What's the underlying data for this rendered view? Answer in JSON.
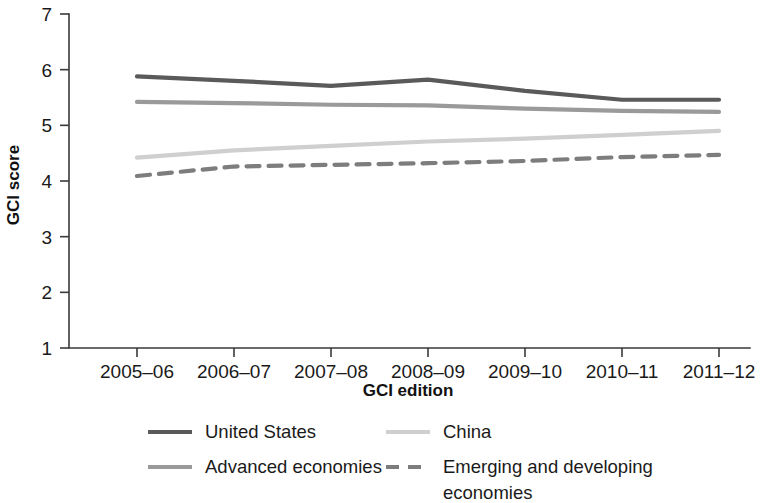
{
  "chart_data": {
    "type": "line",
    "title": "",
    "xlabel": "GCI edition",
    "ylabel": "GCI score",
    "categories": [
      "2005–06",
      "2006–07",
      "2007–08",
      "2008–09",
      "2009–10",
      "2010–11",
      "2011–12"
    ],
    "ylim": [
      1,
      7
    ],
    "yticks": [
      1,
      2,
      3,
      4,
      5,
      6,
      7
    ],
    "ytick_labels": [
      "1",
      "2",
      "3",
      "4",
      "5",
      "6",
      "7"
    ],
    "grid": false,
    "legend_position": "bottom",
    "series": [
      {
        "name": "United States",
        "values": [
          5.88,
          5.8,
          5.71,
          5.82,
          5.62,
          5.46,
          5.46
        ],
        "color": "#5a5a5a",
        "width": 4.2,
        "dash": "none"
      },
      {
        "name": "Advanced economies",
        "values": [
          5.42,
          5.4,
          5.37,
          5.36,
          5.3,
          5.26,
          5.24
        ],
        "color": "#9a9a9a",
        "width": 4.2,
        "dash": "none"
      },
      {
        "name": "China",
        "values": [
          4.42,
          4.55,
          4.63,
          4.71,
          4.76,
          4.83,
          4.9
        ],
        "color": "#cfcfcf",
        "width": 4.2,
        "dash": "none"
      },
      {
        "name": "Emerging and developing economies",
        "values": [
          4.09,
          4.26,
          4.29,
          4.32,
          4.36,
          4.43,
          4.47
        ],
        "color": "#7d7d7d",
        "width": 4.2,
        "dash": "13,9"
      }
    ]
  },
  "legend": {
    "items": [
      {
        "label": "United States",
        "series_index": 0
      },
      {
        "label": "China",
        "series_index": 2
      },
      {
        "label": "Advanced economies",
        "series_index": 1
      },
      {
        "label": "Emerging and developing",
        "label2": "economies",
        "series_index": 3
      }
    ]
  },
  "colors": {
    "background": "#ffffff",
    "axis": "#3a3a3a",
    "text": "#1a1a1a"
  }
}
